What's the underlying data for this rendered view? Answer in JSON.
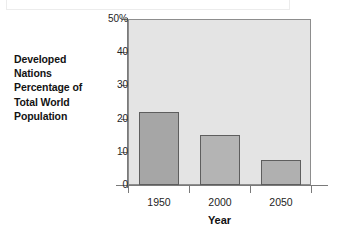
{
  "chart_data": {
    "type": "bar",
    "title": "",
    "side_label": "Developed Nations Percentage of Total World Population",
    "side_label_lines": [
      "Developed",
      "Nations",
      "Percentage of",
      "Total World",
      "Population"
    ],
    "categories": [
      "1950",
      "2000",
      "2050"
    ],
    "values": [
      22,
      15,
      7.5
    ],
    "series": [
      {
        "name": "Developed Nations Percentage of Total World Population",
        "values": [
          22,
          15,
          7.5
        ]
      }
    ],
    "xlabel": "Year",
    "ylabel": "",
    "ylim": [
      0,
      50
    ],
    "yticks": [
      0,
      10,
      20,
      30,
      40,
      50
    ],
    "ytick_labels": [
      "0",
      "10",
      "20",
      "30",
      "40",
      "50%"
    ],
    "xtick_labels": [
      "1950",
      "2000",
      "2050"
    ],
    "grid": false,
    "legend": "none",
    "units": "percent",
    "colors": {
      "plot_background": "#e4e4e4",
      "bar_fill_1950": "#a6a6a6",
      "bar_fill_2000": "#b4b4b4",
      "bar_fill_2050": "#b0b0b0",
      "bar_border": "#5e5e5e",
      "axis": "#7a7a7a",
      "text": "#1a1a1a",
      "page_background": "#ffffff"
    }
  }
}
